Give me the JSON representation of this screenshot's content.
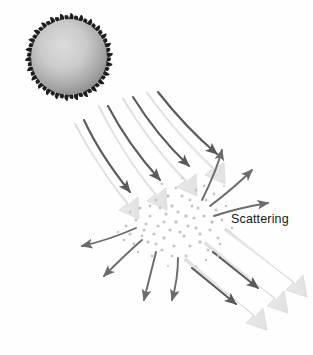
{
  "figure": {
    "width": 313,
    "height": 355,
    "background_color": "#fefefe"
  },
  "labels": {
    "scattering": "Scattering"
  },
  "colors": {
    "beam_fill": "#ebebeb",
    "beam_stroke": "#d2d2d2",
    "thin_arrow": "#5a5a5a",
    "scatter_arrow": "#6b6b6b",
    "particle_dot": "#c4c4c4",
    "virus_core_light": "#d6d6d6",
    "virus_core_dark": "#8f8f8f",
    "virus_spike": "#1e1e1e",
    "label_text": "#161616"
  },
  "elements": {
    "virus": {
      "name": "virus-particle",
      "center_x": 69,
      "center_y": 57,
      "radius": 38,
      "spike_count": 26
    },
    "particle_cloud": {
      "name": "scattering-particle-cloud",
      "center_x": 176,
      "center_y": 222,
      "radius_x": 48,
      "radius_y": 36,
      "dot_count": 96
    },
    "incident_beams": {
      "name": "incident-light-beams",
      "count": 4,
      "direction": "from upper-left virus toward particle cloud"
    },
    "transmitted_beams": {
      "name": "transmitted-light-beams",
      "count": 3,
      "direction": "from particle cloud toward lower-right"
    },
    "scatter_arrows": {
      "name": "scattered-light-arrows",
      "count": 7,
      "direction": "radiating outward from particle cloud"
    }
  }
}
